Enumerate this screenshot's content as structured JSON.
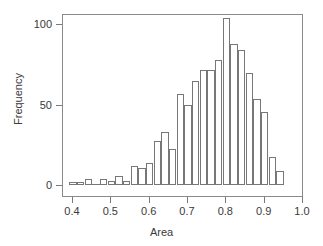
{
  "chart_data": {
    "type": "bar",
    "subtype": "histogram",
    "title": "",
    "xlabel": "Area",
    "ylabel": "Frequency",
    "xlim": [
      0.37,
      1.01
    ],
    "ylim": [
      0,
      110
    ],
    "grid": false,
    "legend": null,
    "bin_width": 0.02,
    "xticks": [
      0.4,
      0.5,
      0.6,
      0.7,
      0.8,
      0.9,
      1.0
    ],
    "xtick_labels": [
      "0.4",
      "0.5",
      "0.6",
      "0.7",
      "0.8",
      "0.9",
      "1.0"
    ],
    "yticks": [
      0,
      50,
      100
    ],
    "ytick_labels": [
      "0",
      "50",
      "100"
    ],
    "bar_color": "#ffffff",
    "bar_edge_color": "#777777",
    "axis_color": "#8a8a8a",
    "text_color": "#3a3a3a",
    "background_color": "#ffffff",
    "bins": [
      {
        "x0": 0.39,
        "x1": 0.41,
        "value": 1
      },
      {
        "x0": 0.41,
        "x1": 0.43,
        "value": 1
      },
      {
        "x0": 0.43,
        "x1": 0.45,
        "value": 3
      },
      {
        "x0": 0.45,
        "x1": 0.47,
        "value": 0
      },
      {
        "x0": 0.47,
        "x1": 0.49,
        "value": 3
      },
      {
        "x0": 0.49,
        "x1": 0.51,
        "value": 2
      },
      {
        "x0": 0.51,
        "x1": 0.53,
        "value": 5
      },
      {
        "x0": 0.53,
        "x1": 0.55,
        "value": 2
      },
      {
        "x0": 0.55,
        "x1": 0.57,
        "value": 11
      },
      {
        "x0": 0.57,
        "x1": 0.59,
        "value": 10
      },
      {
        "x0": 0.59,
        "x1": 0.61,
        "value": 13
      },
      {
        "x0": 0.61,
        "x1": 0.63,
        "value": 27
      },
      {
        "x0": 0.63,
        "x1": 0.65,
        "value": 32
      },
      {
        "x0": 0.65,
        "x1": 0.67,
        "value": 22
      },
      {
        "x0": 0.67,
        "x1": 0.69,
        "value": 56
      },
      {
        "x0": 0.69,
        "x1": 0.71,
        "value": 49
      },
      {
        "x0": 0.71,
        "x1": 0.73,
        "value": 64
      },
      {
        "x0": 0.73,
        "x1": 0.75,
        "value": 71
      },
      {
        "x0": 0.75,
        "x1": 0.77,
        "value": 71
      },
      {
        "x0": 0.77,
        "x1": 0.79,
        "value": 77
      },
      {
        "x0": 0.79,
        "x1": 0.81,
        "value": 103
      },
      {
        "x0": 0.81,
        "x1": 0.83,
        "value": 87
      },
      {
        "x0": 0.83,
        "x1": 0.85,
        "value": 83
      },
      {
        "x0": 0.85,
        "x1": 0.87,
        "value": 69
      },
      {
        "x0": 0.87,
        "x1": 0.89,
        "value": 53
      },
      {
        "x0": 0.89,
        "x1": 0.91,
        "value": 45
      },
      {
        "x0": 0.91,
        "x1": 0.93,
        "value": 17
      },
      {
        "x0": 0.93,
        "x1": 0.95,
        "value": 8
      }
    ]
  }
}
